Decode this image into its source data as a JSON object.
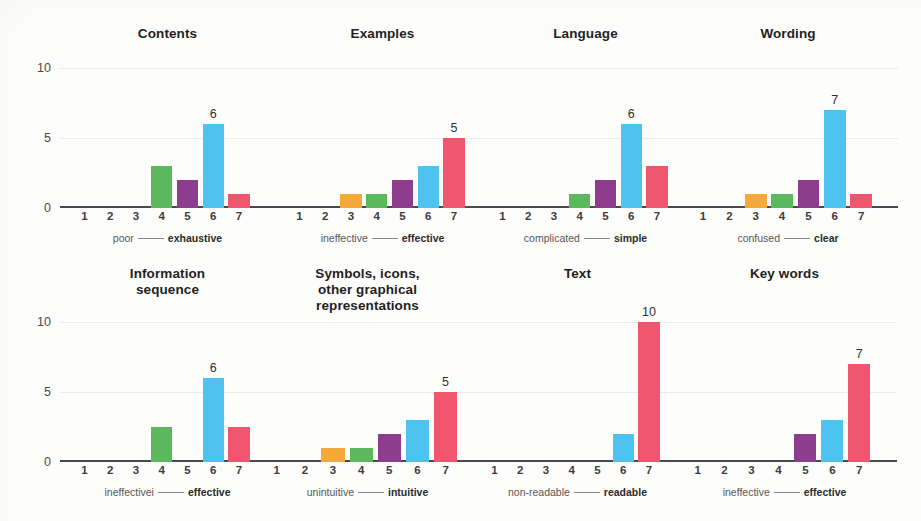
{
  "figure": {
    "background": "#fdfdfc",
    "bar_colors": {
      "1": "#d9534f",
      "2": "#9b59b6",
      "3": "#f5a councils",
      "orange": "#f6a93b",
      "green": "#5cb85c",
      "purple": "#8e3c8e",
      "blue": "#4ec3f0",
      "pink": "#f0566e"
    },
    "axis_color": "#4a4a4a",
    "grid_color": "#eceaea"
  },
  "chart_data": [
    {
      "type": "bar",
      "title": "Contents",
      "xlabel": "",
      "ylabel": "",
      "categories": [
        "1",
        "2",
        "3",
        "4",
        "5",
        "6",
        "7"
      ],
      "values": [
        0,
        0,
        0,
        3,
        2,
        6,
        1
      ],
      "labeled_values": {
        "6": 6
      },
      "anchor_low": "poor",
      "anchor_high": "exhaustive",
      "yticks": [
        "0",
        "5",
        "10"
      ],
      "ylim": [
        0,
        10
      ],
      "grid": true
    },
    {
      "type": "bar",
      "title": "Examples",
      "xlabel": "",
      "ylabel": "",
      "categories": [
        "1",
        "2",
        "3",
        "4",
        "5",
        "6",
        "7"
      ],
      "values": [
        0,
        0,
        1,
        1,
        2,
        3,
        5
      ],
      "labeled_values": {
        "7": 5
      },
      "anchor_low": "ineffective",
      "anchor_high": "effective",
      "yticks": [
        "0",
        "5",
        "10"
      ],
      "ylim": [
        0,
        10
      ],
      "grid": true
    },
    {
      "type": "bar",
      "title": "Language",
      "xlabel": "",
      "ylabel": "",
      "categories": [
        "1",
        "2",
        "3",
        "4",
        "5",
        "6",
        "7"
      ],
      "values": [
        0,
        0,
        0,
        1,
        2,
        6,
        3
      ],
      "labeled_values": {
        "6": 6
      },
      "anchor_low": "complicated",
      "anchor_high": "simple",
      "yticks": [
        "0",
        "5",
        "10"
      ],
      "ylim": [
        0,
        10
      ],
      "grid": true
    },
    {
      "type": "bar",
      "title": "Wording",
      "xlabel": "",
      "ylabel": "",
      "categories": [
        "1",
        "2",
        "3",
        "4",
        "5",
        "6",
        "7"
      ],
      "values": [
        0,
        0,
        1,
        1,
        2,
        7,
        1
      ],
      "labeled_values": {
        "6": 7
      },
      "anchor_low": "confused",
      "anchor_high": "clear",
      "yticks": [
        "0",
        "5",
        "10"
      ],
      "ylim": [
        0,
        10
      ],
      "grid": true
    },
    {
      "type": "bar",
      "title": "Information\nsequence",
      "xlabel": "",
      "ylabel": "",
      "categories": [
        "1",
        "2",
        "3",
        "4",
        "5",
        "6",
        "7"
      ],
      "values": [
        0,
        0,
        0,
        2.5,
        0,
        6,
        2.5
      ],
      "labeled_values": {
        "6": 6
      },
      "anchor_low": "ineffectivei",
      "anchor_high": "effective",
      "yticks": [
        "0",
        "5",
        "10"
      ],
      "ylim": [
        0,
        10
      ],
      "grid": true
    },
    {
      "type": "bar",
      "title": "Symbols, icons,\nother graphical\nrepresentations",
      "xlabel": "",
      "ylabel": "",
      "categories": [
        "1",
        "2",
        "3",
        "4",
        "5",
        "6",
        "7"
      ],
      "values": [
        0,
        0,
        1,
        1,
        2,
        3,
        5
      ],
      "labeled_values": {
        "7": 5
      },
      "anchor_low": "unintuitive",
      "anchor_high": "intuitive",
      "yticks": [
        "0",
        "5",
        "10"
      ],
      "ylim": [
        0,
        10
      ],
      "grid": true
    },
    {
      "type": "bar",
      "title": "Text",
      "xlabel": "",
      "ylabel": "",
      "categories": [
        "1",
        "2",
        "3",
        "4",
        "5",
        "6",
        "7"
      ],
      "values": [
        0,
        0,
        0,
        0,
        0,
        2,
        10
      ],
      "labeled_values": {
        "7": 10
      },
      "anchor_low": "non-readable",
      "anchor_high": "readable",
      "yticks": [
        "0",
        "5",
        "10"
      ],
      "ylim": [
        0,
        10
      ],
      "grid": true
    },
    {
      "type": "bar",
      "title": "Key words",
      "xlabel": "",
      "ylabel": "",
      "categories": [
        "1",
        "2",
        "3",
        "4",
        "5",
        "6",
        "7"
      ],
      "values": [
        0,
        0,
        0,
        0,
        2,
        3,
        7
      ],
      "labeled_values": {
        "7": 7
      },
      "anchor_low": "ineffective",
      "anchor_high": "effective",
      "yticks": [
        "0",
        "5",
        "10"
      ],
      "ylim": [
        0,
        10
      ],
      "grid": true
    }
  ],
  "layout": {
    "rows": [
      {
        "panel_indices": [
          0,
          1,
          2,
          3
        ],
        "show_yaxis": true
      },
      {
        "panel_indices": [
          4,
          5,
          6,
          7
        ],
        "show_yaxis": true
      }
    ],
    "panel_geometry_top": [
      {
        "left": 60,
        "width": 215
      },
      {
        "left": 275,
        "width": 215
      },
      {
        "left": 478,
        "width": 215
      },
      {
        "left": 678,
        "width": 220
      }
    ],
    "panel_geometry_bottom": [
      {
        "left": 60,
        "width": 215
      },
      {
        "left": 250,
        "width": 235
      },
      {
        "left": 470,
        "width": 215
      },
      {
        "left": 672,
        "width": 225
      }
    ]
  }
}
